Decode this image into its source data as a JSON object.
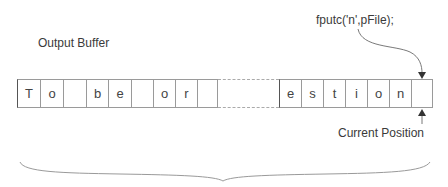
{
  "labels": {
    "buffer_title": "Output Buffer",
    "call": "fputc('n',pFile);",
    "current_position": "Current Position"
  },
  "buffer": {
    "left_cells": [
      "T",
      "o",
      "",
      "b",
      "e",
      "",
      "o",
      "r",
      "",
      ""
    ],
    "right_cells": [
      "e",
      "s",
      "t",
      "i",
      "o",
      "n",
      ""
    ]
  },
  "colors": {
    "border": "#9a9a9a",
    "text": "#3a3a3a",
    "arrow": "#555555"
  }
}
